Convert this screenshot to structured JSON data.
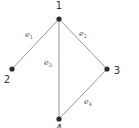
{
  "graph": {
    "vertices": [
      {
        "id": "1",
        "label": "1",
        "x": 59,
        "y": 19,
        "lx": 59,
        "ly": 9
      },
      {
        "id": "2",
        "label": "2",
        "x": 12,
        "y": 69,
        "lx": 7,
        "ly": 83
      },
      {
        "id": "3",
        "label": "3",
        "x": 107,
        "y": 69,
        "lx": 117,
        "ly": 74
      },
      {
        "id": "4",
        "label": "4",
        "x": 59,
        "y": 119,
        "lx": 59,
        "ly": 132
      }
    ],
    "edges": [
      {
        "id": "e1",
        "from": "1",
        "to": "2",
        "label": "e",
        "sub": "1",
        "lx": 29,
        "ly": 37
      },
      {
        "id": "e2",
        "from": "1",
        "to": "3",
        "label": "e",
        "sub": "2",
        "lx": 83,
        "ly": 36
      },
      {
        "id": "e3",
        "from": "1",
        "to": "4",
        "label": "e",
        "sub": "3",
        "lx": 48,
        "ly": 65
      },
      {
        "id": "e4",
        "from": "3",
        "to": "4",
        "label": "e",
        "sub": "4",
        "lx": 88,
        "ly": 104
      }
    ],
    "colors": {
      "edge": "#8a8a8a",
      "vertex": "#2a2a2a",
      "label": "#333333"
    }
  }
}
